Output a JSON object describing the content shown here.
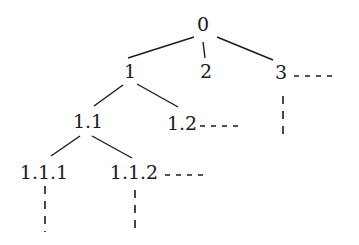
{
  "diagram": {
    "type": "tree",
    "nodes": [
      {
        "id": "0",
        "label": "0",
        "x": 203,
        "y": 31
      },
      {
        "id": "1",
        "label": "1",
        "x": 130,
        "y": 78
      },
      {
        "id": "2",
        "label": "2",
        "x": 206,
        "y": 78
      },
      {
        "id": "3",
        "label": "3",
        "x": 281,
        "y": 79
      },
      {
        "id": "1.1",
        "label": "1.1",
        "x": 88,
        "y": 128
      },
      {
        "id": "1.2",
        "label": "1.2",
        "x": 182,
        "y": 130
      },
      {
        "id": "1.1.1",
        "label": "1.1.1",
        "x": 44,
        "y": 179
      },
      {
        "id": "1.1.2",
        "label": "1.1.2",
        "x": 134,
        "y": 179
      }
    ],
    "edges": [
      {
        "from": "0",
        "to": "1",
        "x1": 194,
        "y1": 37,
        "x2": 128,
        "y2": 58
      },
      {
        "from": "0",
        "to": "2",
        "x1": 203,
        "y1": 42,
        "x2": 205,
        "y2": 58
      },
      {
        "from": "0",
        "to": "3",
        "x1": 217,
        "y1": 37,
        "x2": 273,
        "y2": 60
      },
      {
        "from": "1",
        "to": "1.1",
        "x1": 123,
        "y1": 85,
        "x2": 94,
        "y2": 106
      },
      {
        "from": "1",
        "to": "1.2",
        "x1": 137,
        "y1": 84,
        "x2": 178,
        "y2": 107
      },
      {
        "from": "1.1",
        "to": "1.1.1",
        "x1": 80,
        "y1": 136,
        "x2": 51,
        "y2": 156
      },
      {
        "from": "1.1",
        "to": "1.1.2",
        "x1": 92,
        "y1": 136,
        "x2": 132,
        "y2": 158
      }
    ],
    "continuations": [
      {
        "node": "3",
        "direction": "right",
        "x1": 294,
        "y1": 76,
        "x2": 337,
        "y2": 76
      },
      {
        "node": "3",
        "direction": "down",
        "x1": 283,
        "y1": 96,
        "x2": 283,
        "y2": 141
      },
      {
        "node": "1.2",
        "direction": "right",
        "x1": 200,
        "y1": 126,
        "x2": 242,
        "y2": 126
      },
      {
        "node": "1.1.1",
        "direction": "down",
        "x1": 45,
        "y1": 186,
        "x2": 45,
        "y2": 232
      },
      {
        "node": "1.1.2",
        "direction": "down",
        "x1": 135,
        "y1": 190,
        "x2": 135,
        "y2": 235
      },
      {
        "node": "1.1.2",
        "direction": "right",
        "x1": 165,
        "y1": 175,
        "x2": 206,
        "y2": 175
      }
    ]
  }
}
